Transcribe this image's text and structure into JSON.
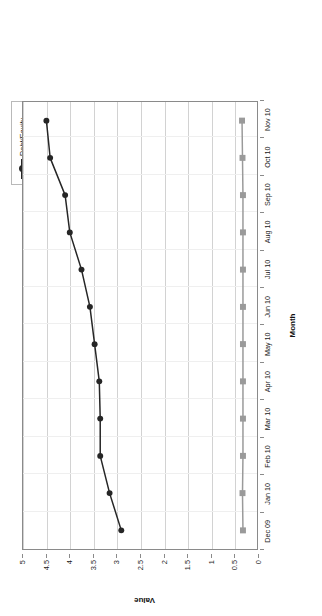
{
  "chart_data": {
    "type": "line",
    "title": "",
    "xlabel": "Month",
    "ylabel": "Value",
    "ylim": [
      0,
      5
    ],
    "ytick_labels": [
      "0",
      "0.5",
      "1",
      "1.5",
      "2",
      "2.5",
      "3",
      "3.5",
      "4",
      "4.5",
      "5"
    ],
    "ytick_values": [
      0,
      0.5,
      1,
      1.5,
      2,
      2.5,
      3,
      3.5,
      4,
      4.5,
      5
    ],
    "grid": true,
    "legend_position": "top-right",
    "categories": [
      "Dec 09",
      "Jan 10",
      "Feb 10",
      "Mar 10",
      "Apr 10",
      "May 10",
      "Jun 10",
      "Jul 10",
      "Aug 10",
      "Sep 10",
      "Oct 10",
      "Nov 10"
    ],
    "series": [
      {
        "name": "Debt/Equity",
        "color": "#262626",
        "marker": "circle",
        "values": [
          2.9,
          3.15,
          3.35,
          3.35,
          3.37,
          3.47,
          3.57,
          3.75,
          4.0,
          4.1,
          4.42,
          4.5
        ]
      },
      {
        "name": "LTDebt/Equity",
        "color": "#9a9a9a",
        "marker": "square",
        "values": [
          0.3,
          0.31,
          0.3,
          0.3,
          0.3,
          0.3,
          0.3,
          0.3,
          0.3,
          0.3,
          0.31,
          0.32
        ]
      }
    ]
  },
  "legend": {
    "entries": [
      {
        "label": "Debt/Equity"
      },
      {
        "label": "LTDebt/Equity"
      }
    ]
  },
  "axes": {
    "x_title": "Month",
    "y_title": "Value"
  }
}
